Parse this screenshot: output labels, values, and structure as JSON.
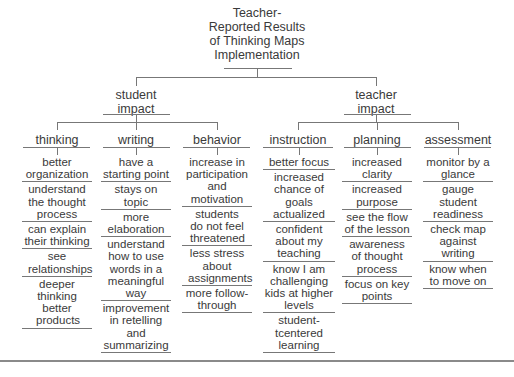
{
  "title": {
    "line1": "Teacher-",
    "line2": "Reported Results",
    "line3": "of Thinking Maps",
    "line4": "Implementation"
  },
  "branches": [
    {
      "label_line1": "student",
      "label_line2": "impact",
      "categories": [
        {
          "label": "thinking",
          "items": [
            "better organization",
            "understand the thought process",
            "can explain their thinking",
            "see relationships",
            "deeper thinking better products"
          ]
        },
        {
          "label": "writing",
          "items": [
            "have a starting point",
            "stays on topic",
            "more elaboration",
            "understand how to use words in a meaningful way",
            "improvement in retelling and summarizing"
          ]
        },
        {
          "label": "behavior",
          "items": [
            "increase in participation and motivation",
            "students do not feel threatened",
            "less stress about assignments",
            "more follow-through"
          ]
        }
      ]
    },
    {
      "label_line1": "teacher",
      "label_line2": "impact",
      "categories": [
        {
          "label": "instruction",
          "items": [
            "better focus",
            "increased chance of goals actualized",
            "confident about my teaching",
            "know I am challenging kids at higher levels",
            "student-tcentered learning"
          ]
        },
        {
          "label": "planning",
          "items": [
            "increased clarity",
            "increased purpose",
            "see the flow of the lesson",
            "awareness of thought process",
            "focus on key points"
          ]
        },
        {
          "label": "assessment",
          "items": [
            "monitor by a glance",
            "gauge student readiness",
            "check map against writing",
            "know when to move on"
          ]
        }
      ]
    }
  ],
  "colors": {
    "line": "#777777",
    "text": "#3a3a3a",
    "background": "#ffffff"
  }
}
